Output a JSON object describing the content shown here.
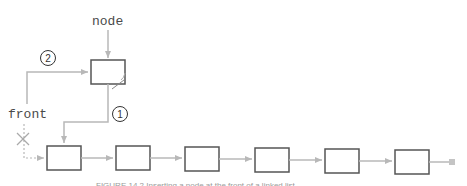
{
  "diagram": {
    "labels": {
      "node": "node",
      "front": "front"
    },
    "steps": [
      {
        "number": "1",
        "description": "node's next set to old front node"
      },
      {
        "number": "2",
        "description": "front set to node"
      }
    ],
    "list_node_count": 6,
    "caption": "FIGURE 14.2 Inserting a node at the front of a linked list",
    "colors": {
      "box_stroke": "#555555",
      "box_fill": "#ffffff",
      "arrow": "#b8b8b8",
      "label": "#4a4a4a"
    }
  }
}
